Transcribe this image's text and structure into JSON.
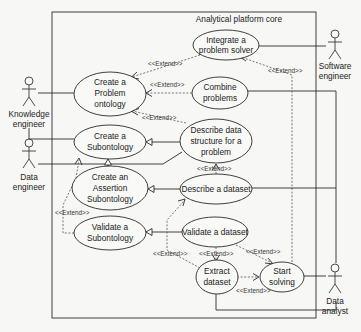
{
  "system": {
    "title": "Analytical platform core"
  },
  "actors": [
    {
      "id": "knowledge_engineer",
      "line1": "Knowledge",
      "line2": "engineer"
    },
    {
      "id": "software_engineer",
      "line1": "Software",
      "line2": "engineer"
    },
    {
      "id": "data_engineer",
      "line1": "Data",
      "line2": "engineer"
    },
    {
      "id": "data_analyst",
      "line1": "Data",
      "line2": "analyst"
    }
  ],
  "use_cases": {
    "integrate": {
      "lines": [
        "Integrate a",
        "problem solver"
      ]
    },
    "create_problem_ontology": {
      "lines": [
        "Create a",
        "Problem",
        "ontology"
      ]
    },
    "combine": {
      "lines": [
        "Combine",
        "problems"
      ]
    },
    "create_subontology": {
      "lines": [
        "Create a",
        "Subontology"
      ]
    },
    "describe_structure": {
      "lines": [
        "Describe data",
        "structure for a",
        "problem"
      ]
    },
    "create_assertion": {
      "lines": [
        "Create an",
        "Assertion",
        "Subontology"
      ]
    },
    "describe_dataset": {
      "lines": [
        "Describe a dataset"
      ]
    },
    "validate_subontology": {
      "lines": [
        "Validate a",
        "Subontology"
      ]
    },
    "validate_dataset": {
      "lines": [
        "Validate a dataset"
      ]
    },
    "extract_dataset": {
      "lines": [
        "Extract",
        "dataset"
      ]
    },
    "start_solving": {
      "lines": [
        "Start",
        "solving"
      ]
    }
  },
  "relationships": {
    "extend_label": "<<Extend>>"
  }
}
